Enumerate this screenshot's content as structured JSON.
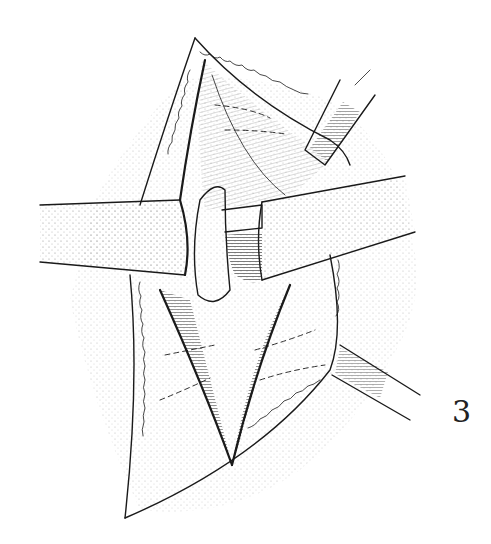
{
  "figure": {
    "number_label": "3",
    "colors": {
      "ink": "#1a1a1a",
      "background": "#ffffff",
      "shade": "#555555"
    }
  }
}
